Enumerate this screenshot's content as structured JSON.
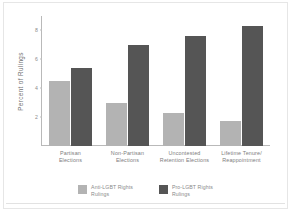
{
  "chart_data": {
    "type": "bar",
    "title": "",
    "xlabel": "",
    "ylabel": "Percent of Rulings",
    "ylim": [
      0,
      9
    ],
    "yticks": [
      2,
      4,
      6,
      8
    ],
    "ytick_labels": [
      "2",
      "4",
      "6",
      "8"
    ],
    "grid": false,
    "legend_position": "bottom",
    "categories": [
      "Partisan Elections",
      "Non-Partisan Elections",
      "Uncontested Retention Elections",
      "Lifetime Tenure/ Reappointment"
    ],
    "category_lines": [
      [
        "Partisan",
        "Elections"
      ],
      [
        "Non-Partisan",
        "Elections"
      ],
      [
        "Uncontested",
        "Retention Elections"
      ],
      [
        "Lifetime Tenure/",
        "Reappointment"
      ]
    ],
    "series": [
      {
        "name": "Anti-LGBT Rights Rulings",
        "name_lines": [
          "Anti-LGBT Rights",
          "Rulings"
        ],
        "color": "#b3b3b3",
        "values": [
          4.5,
          3.0,
          2.3,
          1.7
        ]
      },
      {
        "name": "Pro-LGBT Rights Rulings",
        "name_lines": [
          "Pro-LGBT Rights",
          "Rulings"
        ],
        "color": "#555555",
        "values": [
          5.4,
          7.0,
          7.6,
          8.3
        ]
      }
    ]
  }
}
